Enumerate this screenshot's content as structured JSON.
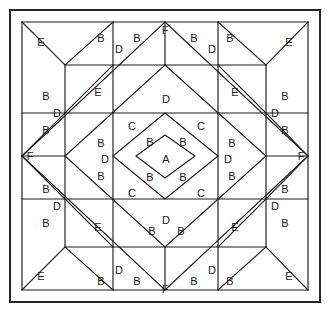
{
  "diagram": {
    "type": "quilt-block-pattern",
    "shape": "square-on-point medallion",
    "canvas": {
      "width": 332,
      "height": 320
    },
    "colors": {
      "background": "#ffffff",
      "line": "#1c1c1c",
      "frame": "#1c1c1c",
      "label": "#1a1a1a"
    },
    "frame": {
      "x": 10,
      "y": 10,
      "width": 310,
      "height": 292
    },
    "piece_legend": [
      "A",
      "B",
      "C",
      "D",
      "E",
      "F"
    ],
    "labels": [
      {
        "id": "l01",
        "text": "E",
        "x": 41,
        "y": 42
      },
      {
        "id": "l02",
        "text": "B",
        "x": 101,
        "y": 38
      },
      {
        "id": "l03",
        "text": "D",
        "x": 119,
        "y": 49
      },
      {
        "id": "l04",
        "text": "B",
        "x": 137,
        "y": 38
      },
      {
        "id": "l05",
        "text": "F",
        "x": 165,
        "y": 30
      },
      {
        "id": "l06",
        "text": "B",
        "x": 194,
        "y": 38
      },
      {
        "id": "l07",
        "text": "D",
        "x": 212,
        "y": 49
      },
      {
        "id": "l08",
        "text": "B",
        "x": 230,
        "y": 38
      },
      {
        "id": "l09",
        "text": "E",
        "x": 289,
        "y": 42
      },
      {
        "id": "l10",
        "text": "B",
        "x": 46,
        "y": 96
      },
      {
        "id": "l11",
        "text": "D",
        "x": 57,
        "y": 113
      },
      {
        "id": "l12",
        "text": "B",
        "x": 46,
        "y": 130
      },
      {
        "id": "l13",
        "text": "E",
        "x": 98,
        "y": 92
      },
      {
        "id": "l14",
        "text": "D",
        "x": 166,
        "y": 99
      },
      {
        "id": "l15",
        "text": "E",
        "x": 235,
        "y": 92
      },
      {
        "id": "l16",
        "text": "B",
        "x": 285,
        "y": 96
      },
      {
        "id": "l17",
        "text": "D",
        "x": 275,
        "y": 113
      },
      {
        "id": "l18",
        "text": "B",
        "x": 285,
        "y": 130
      },
      {
        "id": "l19",
        "text": "C",
        "x": 132,
        "y": 126
      },
      {
        "id": "l20",
        "text": "B",
        "x": 150,
        "y": 142
      },
      {
        "id": "l21",
        "text": "B",
        "x": 183,
        "y": 142
      },
      {
        "id": "l22",
        "text": "C",
        "x": 201,
        "y": 126
      },
      {
        "id": "l23",
        "text": "B",
        "x": 101,
        "y": 143
      },
      {
        "id": "l24",
        "text": "D",
        "x": 105,
        "y": 159
      },
      {
        "id": "l25",
        "text": "A",
        "x": 166,
        "y": 159
      },
      {
        "id": "l26",
        "text": "D",
        "x": 228,
        "y": 159
      },
      {
        "id": "l27",
        "text": "B",
        "x": 232,
        "y": 143
      },
      {
        "id": "l28",
        "text": "F",
        "x": 30,
        "y": 156
      },
      {
        "id": "l29",
        "text": "F",
        "x": 301,
        "y": 156
      },
      {
        "id": "l30",
        "text": "B",
        "x": 101,
        "y": 176
      },
      {
        "id": "l31",
        "text": "B",
        "x": 232,
        "y": 176
      },
      {
        "id": "l32",
        "text": "B",
        "x": 150,
        "y": 177
      },
      {
        "id": "l33",
        "text": "B",
        "x": 183,
        "y": 177
      },
      {
        "id": "l34",
        "text": "C",
        "x": 132,
        "y": 193
      },
      {
        "id": "l35",
        "text": "C",
        "x": 201,
        "y": 193
      },
      {
        "id": "l36",
        "text": "B",
        "x": 46,
        "y": 189
      },
      {
        "id": "l37",
        "text": "D",
        "x": 57,
        "y": 206
      },
      {
        "id": "l38",
        "text": "B",
        "x": 46,
        "y": 223
      },
      {
        "id": "l39",
        "text": "E",
        "x": 98,
        "y": 227
      },
      {
        "id": "l40",
        "text": "D",
        "x": 166,
        "y": 220
      },
      {
        "id": "l41",
        "text": "E",
        "x": 235,
        "y": 227
      },
      {
        "id": "l42",
        "text": "B",
        "x": 285,
        "y": 189
      },
      {
        "id": "l43",
        "text": "D",
        "x": 275,
        "y": 206
      },
      {
        "id": "l44",
        "text": "B",
        "x": 285,
        "y": 223
      },
      {
        "id": "l45",
        "text": "B",
        "x": 152,
        "y": 231
      },
      {
        "id": "l46",
        "text": "B",
        "x": 181,
        "y": 231
      },
      {
        "id": "l47",
        "text": "E",
        "x": 41,
        "y": 276
      },
      {
        "id": "l48",
        "text": "B",
        "x": 101,
        "y": 281
      },
      {
        "id": "l49",
        "text": "D",
        "x": 119,
        "y": 270
      },
      {
        "id": "l50",
        "text": "B",
        "x": 137,
        "y": 281
      },
      {
        "id": "l51",
        "text": "F",
        "x": 165,
        "y": 289
      },
      {
        "id": "l52",
        "text": "B",
        "x": 194,
        "y": 281
      },
      {
        "id": "l53",
        "text": "D",
        "x": 212,
        "y": 270
      },
      {
        "id": "l54",
        "text": "B",
        "x": 230,
        "y": 281
      },
      {
        "id": "l55",
        "text": "E",
        "x": 289,
        "y": 276
      }
    ],
    "paths": [
      {
        "id": "p-outer-square",
        "d": "M 22 22 L 308 22 L 308 290 L 22 290 Z"
      },
      {
        "id": "p-big-diamond",
        "d": "M 165 22 L 308 156 L 165 290 L 22 156 Z"
      },
      {
        "id": "p-inner-square-1",
        "d": "M 65 65 L 266 65 L 266 247 L 65 247 Z"
      },
      {
        "id": "p-mid-diamond",
        "d": "M 165 65 L 266 156 L 165 247 L 65 156 Z"
      },
      {
        "id": "p-center-square",
        "d": "M 113 113 L 218 113 L 218 199 L 113 199 Z"
      },
      {
        "id": "p-center-diamond",
        "d": "M 165 113 L 218 156 L 165 199 L 113 156 Z"
      },
      {
        "id": "p-a-diamond",
        "d": "M 165 135 L 195 156 L 165 178 L 136 156 Z"
      },
      {
        "id": "p-top-spoke",
        "d": "M 165 22 L 165 65"
      },
      {
        "id": "p-bottom-spoke",
        "d": "M 165 247 L 165 290"
      },
      {
        "id": "p-left-spoke",
        "d": "M 22 156 L 65 156"
      },
      {
        "id": "p-right-spoke",
        "d": "M 266 156 L 308 156"
      },
      {
        "id": "p-tl-diag",
        "d": "M 22 22 L 65 65"
      },
      {
        "id": "p-tr-diag",
        "d": "M 308 22 L 266 65"
      },
      {
        "id": "p-bl-diag",
        "d": "M 22 290 L 65 247"
      },
      {
        "id": "p-br-diag",
        "d": "M 308 290 L 266 247"
      },
      {
        "id": "p-tl-wing-a",
        "d": "M 113 22 L 65 65"
      },
      {
        "id": "p-tl-wing-b",
        "d": "M 65 113 L 113 65"
      },
      {
        "id": "p-tl-wing-c",
        "d": "M 65 113 L 22 156"
      },
      {
        "id": "p-tr-wing-a",
        "d": "M 218 22 L 266 65"
      },
      {
        "id": "p-tr-wing-b",
        "d": "M 266 113 L 218 65"
      },
      {
        "id": "p-tr-wing-c",
        "d": "M 266 113 L 308 156"
      },
      {
        "id": "p-bl-wing-a",
        "d": "M 113 290 L 65 247"
      },
      {
        "id": "p-bl-wing-b",
        "d": "M 65 199 L 113 247"
      },
      {
        "id": "p-bl-wing-c",
        "d": "M 65 199 L 22 156"
      },
      {
        "id": "p-br-wing-a",
        "d": "M 218 290 L 266 247"
      },
      {
        "id": "p-br-wing-b",
        "d": "M 266 199 L 218 247"
      },
      {
        "id": "p-br-wing-c",
        "d": "M 266 199 L 308 156"
      },
      {
        "id": "p-top-base-l",
        "d": "M 113 65 L 113 22"
      },
      {
        "id": "p-top-base-r",
        "d": "M 218 65 L 218 22"
      },
      {
        "id": "p-bot-base-l",
        "d": "M 113 247 L 113 290"
      },
      {
        "id": "p-bot-base-r",
        "d": "M 218 247 L 218 290"
      },
      {
        "id": "p-left-base-t",
        "d": "M 65 113 L 22 113"
      },
      {
        "id": "p-left-base-b",
        "d": "M 65 199 L 22 199"
      },
      {
        "id": "p-right-base-t",
        "d": "M 266 113 L 308 113"
      },
      {
        "id": "p-right-base-b",
        "d": "M 266 199 L 308 199"
      },
      {
        "id": "p-mid-tl",
        "d": "M 113 113 L 113 65"
      },
      {
        "id": "p-mid-tr",
        "d": "M 218 113 L 218 65"
      },
      {
        "id": "p-mid-bl",
        "d": "M 113 199 L 113 247"
      },
      {
        "id": "p-mid-br",
        "d": "M 218 199 L 218 247"
      },
      {
        "id": "p-mid-lt",
        "d": "M 113 113 L 65 113"
      },
      {
        "id": "p-mid-lb",
        "d": "M 113 199 L 65 199"
      },
      {
        "id": "p-mid-rt",
        "d": "M 218 113 L 266 113"
      },
      {
        "id": "p-mid-rb",
        "d": "M 218 199 L 266 199"
      }
    ]
  }
}
